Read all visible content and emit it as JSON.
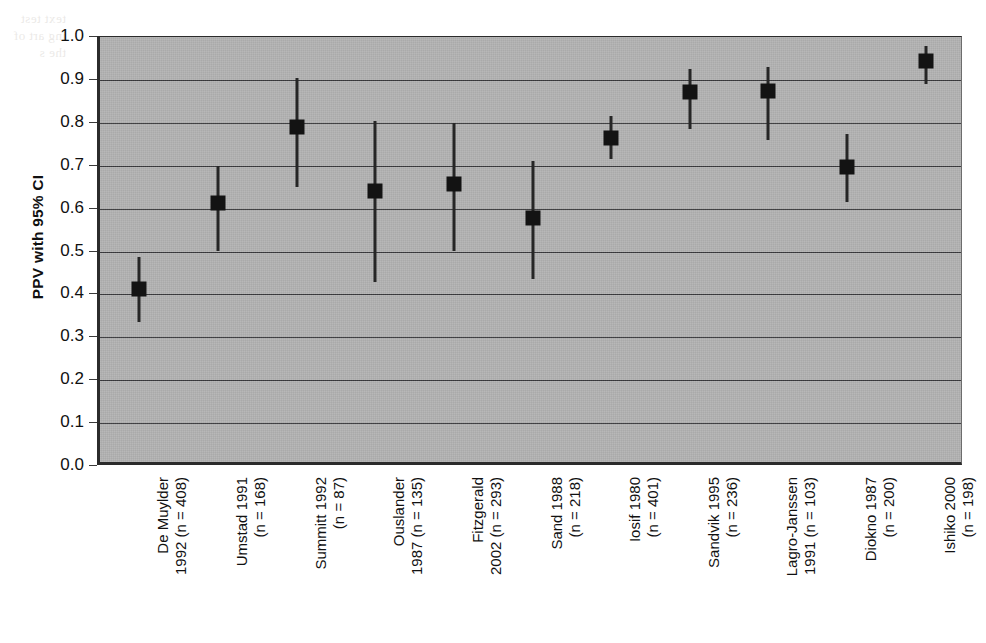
{
  "figure": {
    "background_color": "#ffffff",
    "plot_background_color": "#b3b3b3",
    "marker_color": "#131313",
    "gridline_color": "#39393c",
    "bleed_text": "text test\ning art\nof the s"
  },
  "chart_data": {
    "type": "scatter",
    "title": "",
    "xlabel": "",
    "ylabel": "PPV with 95% CI",
    "ylim": [
      0.0,
      1.0
    ],
    "xlim": [
      0,
      11
    ],
    "grid": true,
    "legend": "none",
    "ytick_labels": [
      "1.0",
      "0.9",
      "0.8",
      "0.7",
      "0.6",
      "0.5",
      "0.4",
      "0.3",
      "0.2",
      "0.1",
      "0.0"
    ],
    "ytick_values": [
      1.0,
      0.9,
      0.8,
      0.7,
      0.6,
      0.5,
      0.4,
      0.3,
      0.2,
      0.1,
      0.0
    ],
    "categories": [
      "De Muylder 1992 (n = 408)",
      "Umstad 1991 (n = 168)",
      "Summitt 1992 (n = 87)",
      "Ouslander 1987 (n = 135)",
      "Fitzgerald 2002 (n = 293)",
      "Sand 1988 (n = 218)",
      "Iosif 1980 (n = 401)",
      "Sandvik 1995 (n = 236)",
      "Lagro-Janssen 1991 (n = 103)",
      "Diokno 1987 (n = 200)",
      "Ishiko 2000 (n = 198)"
    ],
    "category_lines": [
      [
        "De Muylder",
        "1992 (n = 408)"
      ],
      [
        "Umstad 1991",
        "(n = 168)"
      ],
      [
        "Summitt 1992",
        "(n = 87)"
      ],
      [
        "Ouslander",
        "1987 (n = 135)"
      ],
      [
        "Fitzgerald",
        "2002 (n = 293)"
      ],
      [
        "Sand 1988",
        "(n = 218)"
      ],
      [
        "Iosif 1980",
        "(n = 401)"
      ],
      [
        "Sandvik 1995",
        "(n = 236)"
      ],
      [
        "Lagro-Janssen",
        "1991 (n = 103)"
      ],
      [
        "Diokno 1987",
        "(n = 200)"
      ],
      [
        "Ishiko 2000",
        "(n = 198)"
      ]
    ],
    "values": [
      0.412,
      0.613,
      0.79,
      0.64,
      0.658,
      0.577,
      0.765,
      0.872,
      0.874,
      0.697,
      0.945
    ],
    "ci_lower": [
      0.335,
      0.5,
      0.65,
      0.43,
      0.5,
      0.435,
      0.715,
      0.785,
      0.76,
      0.615,
      0.89
    ],
    "ci_upper": [
      0.487,
      0.7,
      0.905,
      0.805,
      0.8,
      0.71,
      0.815,
      0.925,
      0.93,
      0.775,
      0.98
    ]
  }
}
